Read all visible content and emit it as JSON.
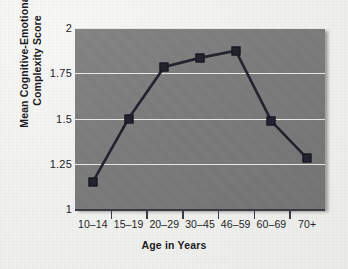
{
  "figure": {
    "background_color": "#f2f2f0",
    "panel_color": "#7b7b7b",
    "line_color": "#23232e",
    "gridline_color": "#f6f6f3"
  },
  "chart_data": {
    "type": "line",
    "title": "",
    "xlabel": "Age in Years",
    "ylabel_lines": [
      "Mean Cognitive-Emotional",
      "Complexity Score"
    ],
    "ylabel": "Mean Cognitive-Emotional Complexity Score",
    "categories": [
      "10–14",
      "15–19",
      "20–29",
      "30–45",
      "46–59",
      "60–69",
      "70+"
    ],
    "values": [
      1.15,
      1.5,
      1.785,
      1.835,
      1.875,
      1.485,
      1.28
    ],
    "ylim": [
      1,
      2
    ],
    "yticks": [
      1,
      1.25,
      1.5,
      1.75,
      2
    ],
    "ytick_labels": [
      "1",
      "1.25",
      "1.5",
      "1.75",
      "2"
    ],
    "grid": "horizontal",
    "legend": "none",
    "marker": "square",
    "series": [
      {
        "name": "Mean Cognitive-Emotional Complexity Score",
        "values": [
          1.15,
          1.5,
          1.785,
          1.835,
          1.875,
          1.485,
          1.28
        ]
      }
    ]
  }
}
